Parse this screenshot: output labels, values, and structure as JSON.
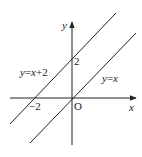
{
  "diagram": {
    "type": "coordinate-plane",
    "axes": {
      "x_label": "x",
      "y_label": "y",
      "origin_label": "O"
    },
    "ticks": {
      "x_neg2": "−2",
      "y_pos2": "2"
    },
    "lines": [
      {
        "equation": "y=x+2",
        "label_parts": [
          "y",
          "=",
          "x",
          "+2"
        ]
      },
      {
        "equation": "y=x",
        "label_parts": [
          "y",
          "=",
          "x"
        ]
      }
    ],
    "colors": {
      "stroke": "#222222",
      "background": "#ffffff"
    }
  }
}
